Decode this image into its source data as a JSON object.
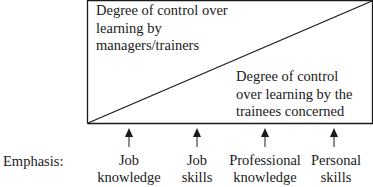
{
  "diagram": {
    "upper_region_label": [
      "Degree of control over",
      "learning by",
      "managers/trainers"
    ],
    "lower_region_label": [
      "Degree of control",
      "over learning by the",
      "trainees concerned"
    ],
    "axis_label": "Emphasis:",
    "items": [
      {
        "line1": "Job",
        "line2": "knowledge"
      },
      {
        "line1": "Job",
        "line2": "skills"
      },
      {
        "line1": "Professional",
        "line2": "knowledge"
      },
      {
        "line1": "Personal",
        "line2": "skills"
      }
    ],
    "colors": {
      "line": "#1a1a1a",
      "background": "#ffffff"
    }
  }
}
